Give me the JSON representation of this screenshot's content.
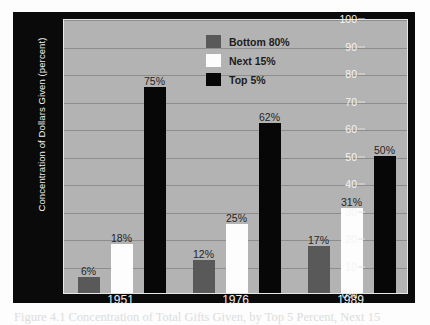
{
  "figure": {
    "caption": "Figure 4.1  Concentration of Total Gifts Given, by Top 5 Percent, Next 15"
  },
  "axes": {
    "ylabel": "Concentration of Dollars Given (percent)",
    "yticks": [
      "100",
      "90",
      "80",
      "70",
      "60",
      "50",
      "40",
      "30",
      "20",
      "10",
      "0%"
    ],
    "xticks": [
      "1951",
      "1976",
      "1989"
    ]
  },
  "legend": {
    "items": [
      {
        "label": "Bottom 80%",
        "color": "#595959",
        "swatch": "sw-bottom"
      },
      {
        "label": "Next 15%",
        "color": "#fdfdfd",
        "swatch": "sw-next"
      },
      {
        "label": "Top 5%",
        "color": "#070707",
        "swatch": "sw-top"
      }
    ]
  },
  "bar_labels": {
    "g1_bottom": "6%",
    "g1_next": "18%",
    "g1_top": "75%",
    "g2_bottom": "12%",
    "g2_next": "25%",
    "g2_top": "62%",
    "g3_bottom": "17%",
    "g3_next": "31%",
    "g3_top": "50%"
  },
  "colors": {
    "plot_background": "#b3b3b3",
    "frame_background": "#0a0a0a",
    "gridline": "#8d8d8d",
    "bottom80": "#595959",
    "next15": "#fdfdfd",
    "top5": "#070707"
  },
  "chart_data": {
    "type": "bar",
    "title": "",
    "xlabel": "",
    "ylabel": "Concentration of Dollars Given (percent)",
    "categories": [
      "1951",
      "1976",
      "1989"
    ],
    "series": [
      {
        "name": "Bottom 80%",
        "values": [
          6,
          18,
          75
        ],
        "color": "#595959"
      },
      {
        "name": "Next 15%",
        "values": [
          12,
          25,
          62
        ],
        "color": "#fdfdfd"
      },
      {
        "name": "Top 5%",
        "values": [
          17,
          31,
          50
        ],
        "color": "#070707"
      }
    ],
    "series_by_group": [
      {
        "name": "Bottom 80%",
        "color": "#595959",
        "values": [
          6,
          12,
          17
        ]
      },
      {
        "name": "Next 15%",
        "color": "#fdfdfd",
        "values": [
          18,
          25,
          31
        ]
      },
      {
        "name": "Top 5%",
        "color": "#070707",
        "values": [
          75,
          62,
          50
        ]
      }
    ],
    "data_labels": [
      "6%",
      "18%",
      "75%",
      "12%",
      "25%",
      "62%",
      "17%",
      "31%",
      "50%"
    ],
    "ylim": [
      0,
      100
    ],
    "ytick_values": [
      0,
      10,
      20,
      30,
      40,
      50,
      60,
      70,
      80,
      90,
      100
    ],
    "grid": true,
    "legend_position": "upper-center"
  }
}
